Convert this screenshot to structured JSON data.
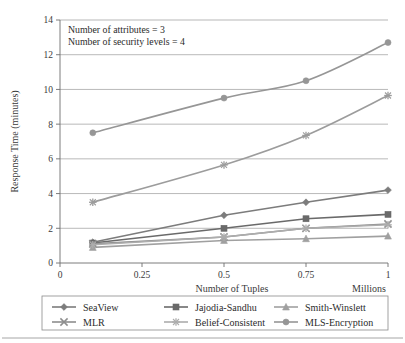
{
  "chart_data": {
    "type": "line",
    "title": "",
    "xlabel": "Number of Tuples",
    "xlabel_unit": "Millions",
    "ylabel": "Response Time  (minutes)",
    "x": [
      0.1,
      0.5,
      0.75,
      1
    ],
    "xlim": [
      0,
      1
    ],
    "ylim": [
      0,
      14
    ],
    "xticks": [
      "0",
      "0.25",
      "0.5",
      "0.75",
      "1"
    ],
    "xtick_values": [
      0,
      0.25,
      0.5,
      0.75,
      1
    ],
    "yticks": [
      "0",
      "2",
      "4",
      "6",
      "8",
      "10",
      "12",
      "14"
    ],
    "ytick_values": [
      0,
      2,
      4,
      6,
      8,
      10,
      12,
      14
    ],
    "grid": "horizontal",
    "legend_position": "bottom",
    "annotations": [
      "Number of attributes = 3",
      "Number of security levels = 4"
    ],
    "series": [
      {
        "name": "SeaView",
        "marker": "diamond",
        "color": "#7c7c7c",
        "values": [
          1.2,
          2.75,
          3.5,
          4.2
        ]
      },
      {
        "name": "Jajodia-Sandhu",
        "marker": "square",
        "color": "#6a6a6a",
        "values": [
          1.15,
          2.0,
          2.55,
          2.8
        ]
      },
      {
        "name": "Smith-Winslett",
        "marker": "triangle",
        "color": "#a0a0a0",
        "values": [
          0.9,
          1.3,
          1.4,
          1.55
        ]
      },
      {
        "name": "MLR",
        "marker": "cross",
        "color": "#8d8d8d",
        "values": [
          1.1,
          1.5,
          2.0,
          2.25
        ]
      },
      {
        "name": "Belief-Consistent",
        "marker": "star",
        "color": "#adadad",
        "values": [
          1.05,
          1.5,
          2.0,
          2.2
        ]
      },
      {
        "name": "MLS-Encryption",
        "marker": "circle",
        "color": "#969696",
        "values": [
          7.5,
          9.5,
          10.5,
          12.7
        ]
      }
    ],
    "highlight_series": [
      {
        "name": "MLS-Encryption",
        "values": [
          7.5,
          9.5,
          10.5,
          12.7
        ]
      },
      {
        "name": "MLR-upper",
        "values": [
          3.5,
          5.65,
          7.35,
          9.65
        ]
      }
    ]
  },
  "legend": {
    "entries": [
      {
        "label": "SeaView",
        "marker": "diamond"
      },
      {
        "label": "Jajodia-Sandhu",
        "marker": "square"
      },
      {
        "label": "Smith-Winslett",
        "marker": "triangle"
      },
      {
        "label": "MLR",
        "marker": "cross"
      },
      {
        "label": "Belief-Consistent",
        "marker": "star"
      },
      {
        "label": "MLS-Encryption",
        "marker": "circle"
      }
    ]
  }
}
